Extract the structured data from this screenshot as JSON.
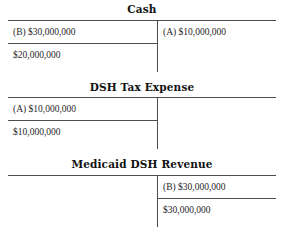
{
  "document": {
    "kind": "t-account-ledger",
    "line_color": "#4d4d4d",
    "text_color": "#1f1f1f",
    "background": "#ffffff"
  },
  "accounts": [
    {
      "title": "Cash",
      "subtotal_side": "left",
      "debit_entry": "(B) $30,000,000",
      "credit_entry": "(A) $10,000,000",
      "debit_subtotal": "$20,000,000",
      "credit_subtotal": ""
    },
    {
      "title": "DSH Tax Expense",
      "subtotal_side": "left",
      "debit_entry": "(A) $10,000,000",
      "credit_entry": "",
      "debit_subtotal": "$10,000,000",
      "credit_subtotal": ""
    },
    {
      "title": "Medicaid DSH Revenue",
      "subtotal_side": "right",
      "debit_entry": "",
      "credit_entry": "(B) $30,000,000",
      "debit_subtotal": "",
      "credit_subtotal": "$30,000,000"
    }
  ]
}
